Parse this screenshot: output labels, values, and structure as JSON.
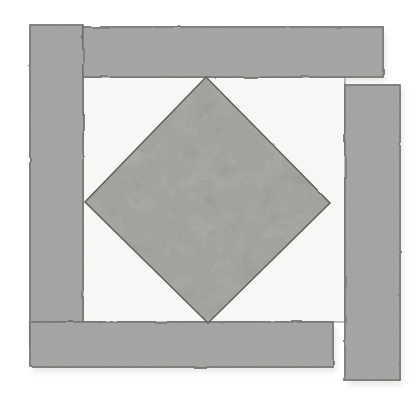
{
  "illustration": {
    "title": "Square-in-a-Square quilt block diagram",
    "type": "quilt-block-diagram",
    "canvas": {
      "width": 420,
      "height": 395
    },
    "background_color": "#ffffff"
  },
  "palette": {
    "page_background": "#ffffff",
    "strip_fill": "#a8a9a7",
    "strip_fill_shaded": "#9fa09e",
    "strip_outline": "#6f706e",
    "inner_background": "#f7f7f5",
    "inner_outline": "#8d8e8c",
    "diamond_base": "#a9aaa6",
    "diamond_blobs": "#8e908a",
    "diamond_outline": "#5f605e",
    "shadow": "#d8d8d6"
  },
  "elements": {
    "left_strip": {
      "label": "Left border strip",
      "orientation": "vertical",
      "x": 30,
      "y": 25,
      "width": 53,
      "height": 322,
      "fill": "#a8a9a7"
    },
    "top_strip": {
      "label": "Top border strip",
      "orientation": "horizontal",
      "x": 83,
      "y": 27,
      "width": 300,
      "height": 50,
      "fill": "#a8a9a7"
    },
    "right_strip": {
      "label": "Right border strip",
      "orientation": "vertical",
      "x": 345,
      "y": 85,
      "width": 55,
      "height": 295,
      "fill": "#a8a9a7"
    },
    "bottom_strip": {
      "label": "Bottom border strip",
      "orientation": "horizontal",
      "x": 30,
      "y": 322,
      "width": 303,
      "height": 45,
      "fill": "#a8a9a7"
    },
    "inner_square": {
      "label": "Inner background square",
      "x": 83,
      "y": 77,
      "width": 262,
      "height": 245,
      "fill": "#f7f7f5"
    },
    "center_diamond": {
      "label": "Center patterned diamond",
      "shape": "square rotated 45 degrees",
      "vertices": {
        "top": {
          "x": 206,
          "y": 77
        },
        "right": {
          "x": 330,
          "y": 203
        },
        "bottom": {
          "x": 208,
          "y": 323
        },
        "left": {
          "x": 85,
          "y": 202
        }
      },
      "fill": "#a9aaa6",
      "pattern": "mottled-leopard-print"
    }
  },
  "annotations": {
    "strip_count": "4",
    "pattern_name": "Square in a Square",
    "style": "hand-drawn watercolor / pencil sketch"
  }
}
